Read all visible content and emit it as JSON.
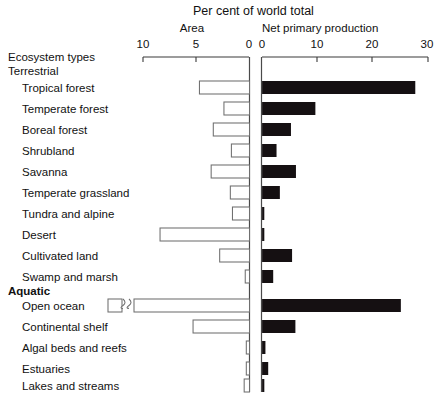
{
  "header": {
    "title": "Per cent of world total",
    "left_panel_label": "Area",
    "right_panel_label": "Net primary  production",
    "row_header": "Ecosystem types"
  },
  "axes": {
    "left_ticks": [
      "10",
      "5",
      "0"
    ],
    "left_tick_values": [
      10,
      5,
      0
    ],
    "right_ticks": [
      "0",
      "10",
      "20",
      "30"
    ],
    "right_tick_values": [
      0,
      10,
      20,
      30
    ]
  },
  "groups": [
    {
      "label": "Terrestrial",
      "bold": false
    },
    {
      "label": "Aquatic",
      "bold": true
    }
  ],
  "chart_data": {
    "type": "bar",
    "title": "Per cent of world total",
    "subtitle": "",
    "orientation": "horizontal-diverging",
    "xlabel": "Per cent of world total",
    "ylabel": "Ecosystem types",
    "grid": false,
    "legend_position": "top",
    "series": [
      {
        "name": "Area",
        "direction": "left",
        "color": "#ffffff",
        "edge_color": "#6f6f6f",
        "axis_label": "Area",
        "axis_range": [
          10,
          0
        ],
        "values": [
          4.7,
          2.4,
          3.4,
          1.7,
          3.6,
          1.8,
          1.6,
          8.4,
          2.8,
          0.4,
          65.1,
          5.3,
          0.3,
          0.3,
          0.5
        ]
      },
      {
        "name": "Net primary production",
        "direction": "right",
        "color": "#151012",
        "axis_label": "Net primary  production",
        "axis_range": [
          0,
          30
        ],
        "values": [
          27.6,
          9.6,
          5.2,
          2.6,
          6.1,
          3.2,
          0.3,
          0.4,
          5.4,
          2.0,
          25.0,
          6.0,
          0.6,
          1.1,
          0.4
        ]
      }
    ],
    "categories": [
      "Tropical forest",
      "Temperate forest",
      "Boreal forest",
      "Shrubland",
      "Savanna",
      "Temperate grassland",
      "Tundra and alpine",
      "Desert",
      "Cultivated land",
      "Swamp and marsh",
      "Open ocean",
      "Continental shelf",
      "Algal beds and reefs",
      "Estuaries",
      "Lakes and streams"
    ],
    "category_groups": [
      "Terrestrial",
      "Terrestrial",
      "Terrestrial",
      "Terrestrial",
      "Terrestrial",
      "Terrestrial",
      "Terrestrial",
      "Terrestrial",
      "Terrestrial",
      "Terrestrial",
      "Aquatic",
      "Aquatic",
      "Aquatic",
      "Aquatic",
      "Aquatic"
    ],
    "annotations": [
      {
        "category": "Open ocean",
        "series": "Area",
        "note": "axis break",
        "symbol": "double-squiggle-break"
      }
    ]
  }
}
